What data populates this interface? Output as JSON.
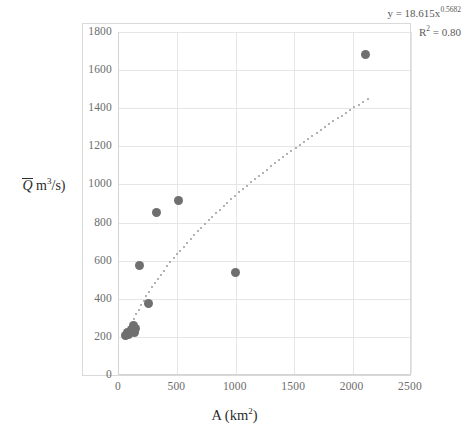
{
  "chart_data": {
    "type": "scatter",
    "title": "",
    "xlabel": "A (km2)",
    "ylabel": "Q m3/s)",
    "xlim": [
      0,
      2500
    ],
    "ylim": [
      0,
      1800
    ],
    "grid": true,
    "legend": "none",
    "xticks": [
      0,
      500,
      1000,
      1500,
      2000,
      2500
    ],
    "yticks": [
      0,
      200,
      400,
      600,
      800,
      1000,
      1200,
      1400,
      1600,
      1800
    ],
    "series": [
      {
        "name": "observed",
        "marker": "filled-circle",
        "color": "#6f6f6f",
        "points": [
          {
            "x": 55,
            "y": 205
          },
          {
            "x": 70,
            "y": 225
          },
          {
            "x": 80,
            "y": 215
          },
          {
            "x": 110,
            "y": 240
          },
          {
            "x": 125,
            "y": 235
          },
          {
            "x": 135,
            "y": 225
          },
          {
            "x": 140,
            "y": 245
          },
          {
            "x": 120,
            "y": 260
          },
          {
            "x": 175,
            "y": 575
          },
          {
            "x": 255,
            "y": 375
          },
          {
            "x": 320,
            "y": 855
          },
          {
            "x": 510,
            "y": 915
          },
          {
            "x": 1000,
            "y": 540
          },
          {
            "x": 2110,
            "y": 1680
          }
        ]
      }
    ],
    "trendline": {
      "type": "power",
      "style": "dotted",
      "color": "#9a9a9a",
      "equation": "y = 18.615x",
      "exponent": "0.5682",
      "r2_label": "R",
      "r2_sup": "2",
      "r2_value": " = 0.80",
      "coefficient": 18.615,
      "x_start": 60,
      "x_end": 2150
    },
    "annotations": {
      "equation_text": "y = 18.615x",
      "equation_exponent": "0.5682",
      "r2_text": "R",
      "r2_exponent": "2",
      "r2_rest": " = 0.80"
    }
  },
  "axis": {
    "x_title_main": "A (km",
    "x_title_sup": "2",
    "x_title_close": ")",
    "y_title_symbol": "Q",
    "y_title_unit_main": " m",
    "y_title_unit_sup": "3",
    "y_title_unit_rest": "/s)"
  },
  "colors": {
    "marker": "#6f6f6f",
    "trendline": "#9a9a9a",
    "gridline": "#e6e6e6",
    "axis": "#d4d4d4",
    "frame": "#d9d9d9",
    "tick_text": "#6b6b6b",
    "title_text": "#2b2b2b"
  }
}
